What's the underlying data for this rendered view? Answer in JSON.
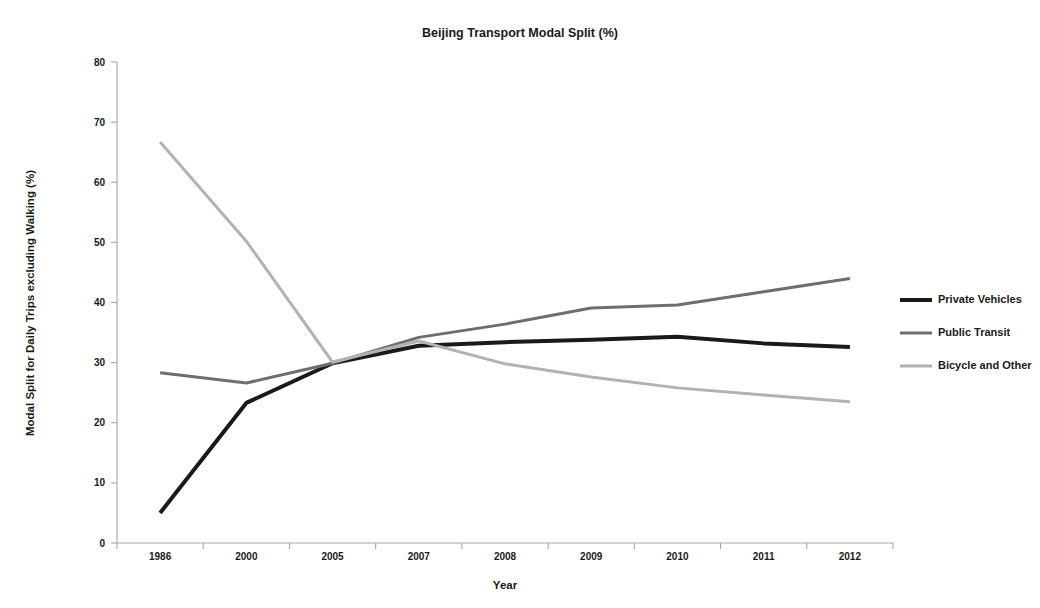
{
  "chart_data": {
    "type": "line",
    "title": "Beijing Transport Modal Split (%)",
    "xlabel": "Year",
    "ylabel": "Modal Split for Daily Trips excluding Walking (%)",
    "categories": [
      "1986",
      "2000",
      "2005",
      "2007",
      "2008",
      "2009",
      "2010",
      "2011",
      "2012"
    ],
    "ylim": [
      0,
      80
    ],
    "yticks": [
      0,
      10,
      20,
      30,
      40,
      50,
      60,
      70,
      80
    ],
    "grid": false,
    "legend_position": "right",
    "series": [
      {
        "name": "Private Vehicles",
        "color": "#1a1a1a",
        "width": 4.0,
        "values": [
          5.0,
          23.3,
          29.9,
          32.8,
          33.4,
          33.8,
          34.3,
          33.2,
          32.6
        ]
      },
      {
        "name": "Public Transit",
        "color": "#6e6e6e",
        "width": 3.0,
        "values": [
          28.3,
          26.6,
          29.9,
          34.2,
          36.4,
          39.1,
          39.6,
          41.8,
          44.0
        ]
      },
      {
        "name": "Bicycle and Other",
        "color": "#b2b2b2",
        "width": 3.0,
        "values": [
          66.7,
          50.2,
          30.1,
          33.6,
          29.8,
          27.6,
          25.8,
          24.6,
          23.5
        ]
      }
    ]
  }
}
